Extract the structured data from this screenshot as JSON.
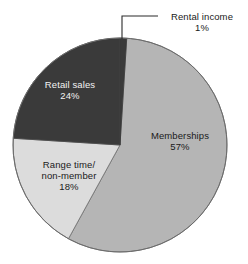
{
  "chart_data": {
    "type": "pie",
    "title": "",
    "subtitle": "",
    "xlabel": "",
    "ylabel": "",
    "grid": false,
    "legend_position": "none",
    "label_style": "slice-labels-with-leader-line",
    "start_angle_deg": 0,
    "direction": "clockwise",
    "categories": [
      "Rental income",
      "Memberships",
      "Range time/ non-member",
      "Retail sales"
    ],
    "values": [
      1,
      57,
      18,
      24
    ],
    "value_unit": "%",
    "slices": [
      {
        "label": "Rental income",
        "label_lines": [
          "Rental income"
        ],
        "value": 1,
        "value_text": "1%",
        "color": "#3a3a3a",
        "label_placement": "outside-top-right",
        "leader_line": true
      },
      {
        "label": "Memberships",
        "label_lines": [
          "Memberships"
        ],
        "value": 57,
        "value_text": "57%",
        "color": "#b5b5b5",
        "label_placement": "inside-right",
        "leader_line": false
      },
      {
        "label": "Range time/ non-member",
        "label_lines": [
          "Range time/",
          "non-member"
        ],
        "value": 18,
        "value_text": "18%",
        "color": "#dcdcdc",
        "label_placement": "inside-lower-left",
        "leader_line": false
      },
      {
        "label": "Retail sales",
        "label_lines": [
          "Retail sales"
        ],
        "value": 24,
        "value_text": "24%",
        "color": "#3a3a3a",
        "label_placement": "inside-upper-left",
        "leader_line": false
      }
    ]
  },
  "labels": {
    "rental": {
      "name": "Rental income",
      "value": "1%"
    },
    "memberships": {
      "name": "Memberships",
      "value": "57%"
    },
    "range": {
      "name_line1": "Range time/",
      "name_line2": "non-member",
      "value": "18%"
    },
    "retail": {
      "name": "Retail sales",
      "value": "24%"
    }
  },
  "colors": {
    "background": "#ffffff",
    "memberships": "#b5b5b5",
    "range_time": "#dcdcdc",
    "retail_sales": "#3a3a3a",
    "rental_income": "#3a3a3a",
    "outline": "#4a4a4a",
    "leader_line": "#2b2b2b",
    "text_dark": "#1a1a1a",
    "text_light": "#f2f2f2"
  }
}
